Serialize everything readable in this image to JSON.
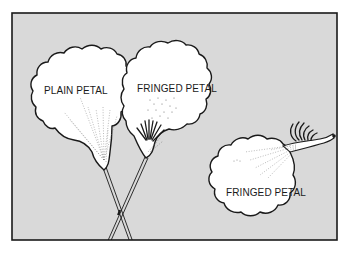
{
  "figure": {
    "background_color": "#d9d9d9",
    "frame_color": "#1a1a1a",
    "petal_fill": "#ffffff",
    "labels": {
      "plain_petal": "PLAIN PETAL",
      "fringed_petal_upright": "FRINGED PETAL",
      "fringed_petal_lying": "FRINGED PETAL"
    }
  }
}
